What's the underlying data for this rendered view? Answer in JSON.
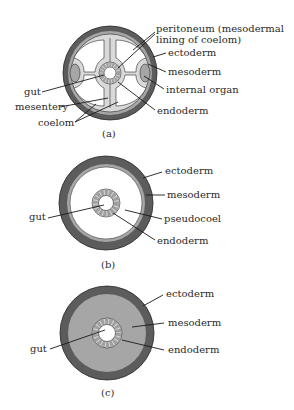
{
  "figure": {
    "colors": {
      "ectoderm": "#5c5c5c",
      "mesoderm": "#a6a6a6",
      "peritoneum": "#d9d9d9",
      "cavity": "#ffffff",
      "endoderm_cells": "#d4d4d4",
      "outline": "#2a2a2a"
    },
    "panels": [
      {
        "caption": "(a)",
        "type": "coelomate",
        "labels": {
          "peritoneum_line1": "peritoneum (mesodermal",
          "peritoneum_line2": "lining of coelom)",
          "ectoderm": "ectoderm",
          "mesoderm": "mesoderm",
          "internal_organ": "internal organ",
          "endoderm": "endoderm",
          "gut": "gut",
          "mesentery": "mesentery",
          "coelom": "coelom"
        }
      },
      {
        "caption": "(b)",
        "type": "pseudocoelomate",
        "labels": {
          "ectoderm": "ectoderm",
          "mesoderm": "mesoderm",
          "pseudocoel": "pseudocoel",
          "endoderm": "endoderm",
          "gut": "gut"
        }
      },
      {
        "caption": "(c)",
        "type": "acoelomate",
        "labels": {
          "ectoderm": "ectoderm",
          "mesoderm": "mesoderm",
          "endoderm": "endoderm",
          "gut": "gut"
        }
      }
    ]
  }
}
